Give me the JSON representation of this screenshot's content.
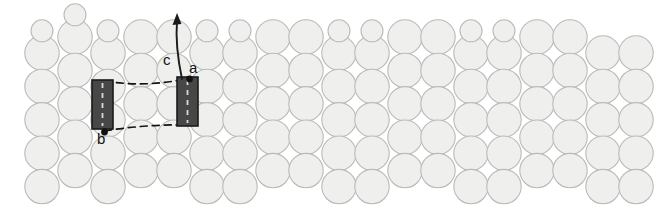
{
  "figure": {
    "type": "crystal-lattice-packing-diagram",
    "width": 669,
    "height": 211,
    "background_color": "#ffffff"
  },
  "atoms": {
    "fill_color": "#eff0ee",
    "stroke_color": "#b9bbb8",
    "stroke_width": 1.1,
    "large_radius": 17.2,
    "small_radius": 11.0,
    "column_spacing": 33.2,
    "row_spacing": 33.4,
    "columns": [
      {
        "cx": 42,
        "offset": 0,
        "small_top": true
      },
      {
        "cx": 75,
        "offset": -16,
        "small_top": true
      },
      {
        "cx": 108,
        "offset": 0,
        "small_top": true
      },
      {
        "cx": 141,
        "offset": -16,
        "small_top": false
      },
      {
        "cx": 174,
        "offset": -16,
        "small_top": false
      },
      {
        "cx": 207,
        "offset": 0,
        "small_top": true
      },
      {
        "cx": 240,
        "offset": 0,
        "small_top": true
      },
      {
        "cx": 273,
        "offset": -16,
        "small_top": false
      },
      {
        "cx": 306,
        "offset": -16,
        "small_top": false
      },
      {
        "cx": 339,
        "offset": 0,
        "small_top": true
      },
      {
        "cx": 372,
        "offset": 0,
        "small_top": true
      },
      {
        "cx": 405,
        "offset": -16,
        "small_top": false
      },
      {
        "cx": 438,
        "offset": -16,
        "small_top": false
      },
      {
        "cx": 471,
        "offset": 0,
        "small_top": true
      },
      {
        "cx": 504,
        "offset": 0,
        "small_top": true
      },
      {
        "cx": 537,
        "offset": -16,
        "small_top": false
      },
      {
        "cx": 570,
        "offset": -16,
        "small_top": false
      },
      {
        "cx": 603,
        "offset": 0,
        "small_top": false
      },
      {
        "cx": 636,
        "offset": 0,
        "small_top": false
      }
    ]
  },
  "unit_cell": {
    "rectangle_fill": "#484747",
    "rectangle_stroke": "#1b1b1b",
    "dash_color": "#141414",
    "left_rect": {
      "x": 92,
      "y": 80,
      "width": 21,
      "height": 49
    },
    "right_rect": {
      "x": 177,
      "y": 77,
      "width": 21,
      "height": 49
    },
    "top_edge_label": "a",
    "side_edge_label": "b",
    "vertical_axis_label": "c",
    "arrow": {
      "x1": 182,
      "y1": 79,
      "x2": 177,
      "y2": 13
    }
  },
  "labels": {
    "a": "a",
    "b": "b",
    "c": "c"
  }
}
